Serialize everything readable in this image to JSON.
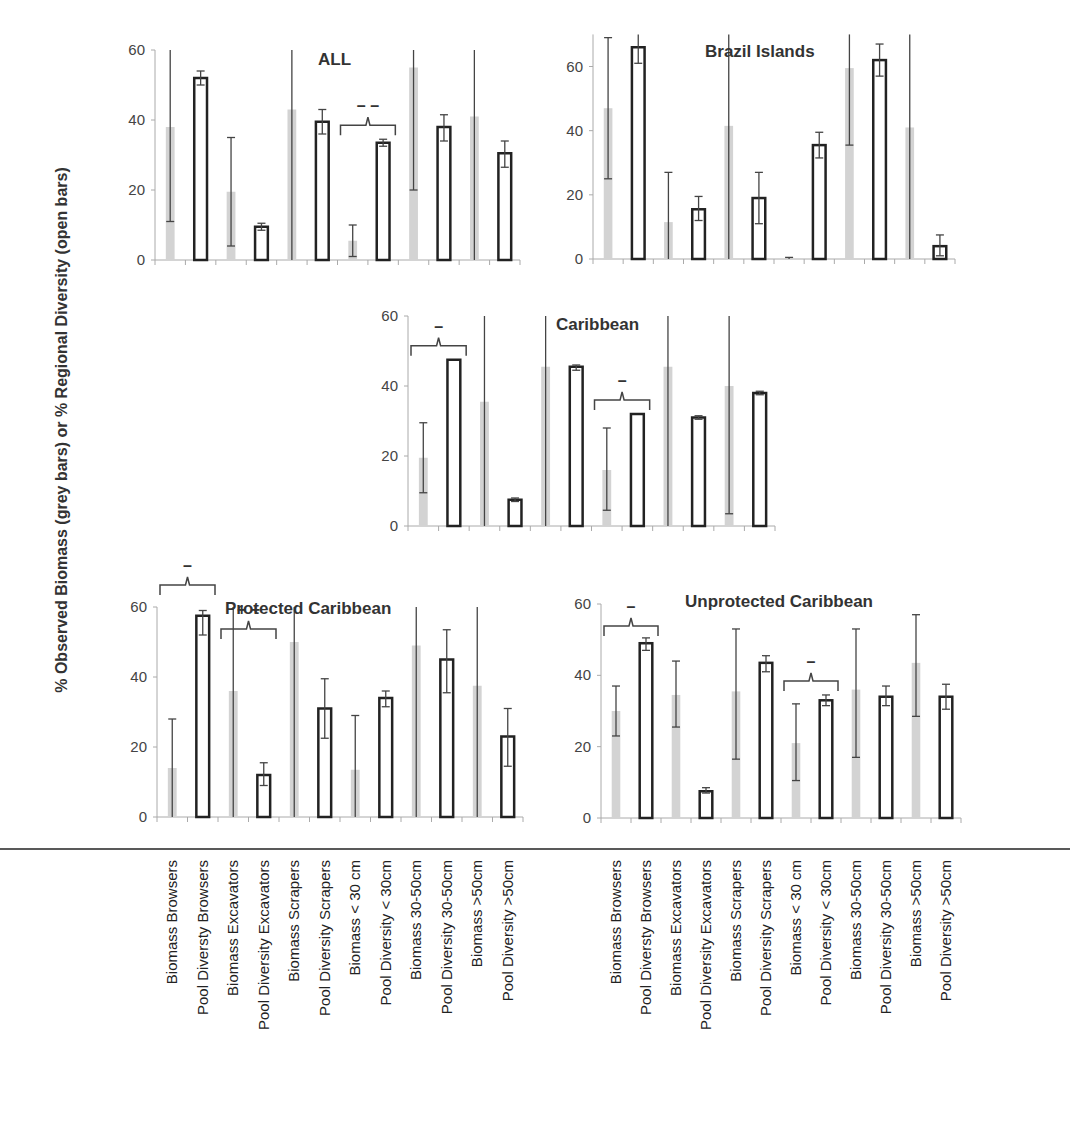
{
  "figure": {
    "y_axis_label": "% Observed Biomass (grey bars) or % Regional Diversity (open bars)",
    "categories": [
      "Biomass Browsers",
      "Pool Diversty Browsers",
      "Biomass Excavators",
      "Pool Diversity Excavators",
      "Biomass Scrapers",
      "Pool Diversity Scrapers",
      "Biomass < 30 cm",
      "Pool Diversity < 30cm",
      "Biomass 30-50cm",
      "Pool Diversity 30-50cm",
      "Biomass >50cm",
      "Pool Diversity >50cm"
    ],
    "colors": {
      "grey_bar": "#d3d3d3",
      "open_bar_stroke": "#222222",
      "axis": "#aaaaaa"
    }
  },
  "chart_data": [
    {
      "type": "bar",
      "title": "ALL",
      "ylabel": "% Observed Biomass (grey bars) or % Regional Diversity (open bars)",
      "ylim": [
        0,
        60
      ],
      "yticks": [
        0,
        20,
        40,
        60
      ],
      "categories": [
        "Biomass Browsers",
        "Pool Diversty Browsers",
        "Biomass Excavators",
        "Pool Diversity Excavators",
        "Biomass Scrapers",
        "Pool Diversity Scrapers",
        "Biomass < 30 cm",
        "Pool Diversity < 30cm",
        "Biomass 30-50cm",
        "Pool Diversity 30-50cm",
        "Biomass >50cm",
        "Pool Diversity >50cm"
      ],
      "bar_style": [
        "grey",
        "open",
        "grey",
        "open",
        "grey",
        "open",
        "grey",
        "open",
        "grey",
        "open",
        "grey",
        "open"
      ],
      "values": [
        38,
        52,
        19.5,
        9.5,
        43,
        39.5,
        5.5,
        33.5,
        55,
        38,
        41,
        30.5
      ],
      "error_low": [
        11,
        50,
        4,
        8.5,
        0,
        36,
        1,
        32.5,
        20,
        34,
        0,
        26.5
      ],
      "error_high": [
        60,
        54,
        35,
        10.5,
        60,
        43,
        10,
        34.5,
        60,
        41.5,
        60,
        34
      ],
      "annotations": [
        {
          "text": "– –",
          "bracket_from": 6,
          "bracket_to": 7
        }
      ],
      "grid": false
    },
    {
      "type": "bar",
      "title": "Brazil Islands",
      "ylim": [
        0,
        70
      ],
      "yticks": [
        0,
        20,
        40,
        60
      ],
      "categories": [
        "Biomass Browsers",
        "Pool Diversty Browsers",
        "Biomass Excavators",
        "Pool Diversity Excavators",
        "Biomass Scrapers",
        "Pool Diversity Scrapers",
        "Biomass < 30 cm",
        "Pool Diversity < 30cm",
        "Biomass 30-50cm",
        "Pool Diversity 30-50cm",
        "Biomass >50cm",
        "Pool Diversity >50cm"
      ],
      "bar_style": [
        "grey",
        "open",
        "grey",
        "open",
        "grey",
        "open",
        "grey",
        "open",
        "grey",
        "open",
        "grey",
        "open"
      ],
      "values": [
        47,
        66,
        11.5,
        15.5,
        41.5,
        19,
        0.3,
        35.5,
        59.5,
        62,
        41,
        4
      ],
      "error_low": [
        25,
        61,
        0,
        12,
        0,
        11,
        0,
        31.5,
        35.5,
        57,
        0,
        1
      ],
      "error_high": [
        69,
        70,
        27,
        19.5,
        70,
        27,
        0.5,
        39.5,
        70,
        67,
        70,
        7.5
      ],
      "annotations": [],
      "grid": false
    },
    {
      "type": "bar",
      "title": "Caribbean",
      "ylim": [
        0,
        60
      ],
      "yticks": [
        0,
        20,
        40,
        60
      ],
      "categories": [
        "Biomass Browsers",
        "Pool Diversty Browsers",
        "Biomass Excavators",
        "Pool Diversity Excavators",
        "Biomass Scrapers",
        "Pool Diversity Scrapers",
        "Biomass < 30 cm",
        "Pool Diversity < 30cm",
        "Biomass 30-50cm",
        "Pool Diversity 30-50cm",
        "Biomass >50cm",
        "Pool Diversity >50cm"
      ],
      "bar_style": [
        "grey",
        "open",
        "grey",
        "open",
        "grey",
        "open",
        "grey",
        "open",
        "grey",
        "open",
        "grey",
        "open"
      ],
      "values": [
        19.5,
        47.5,
        35.5,
        7.5,
        45.5,
        45.5,
        16,
        32,
        45.5,
        31,
        40,
        38
      ],
      "error_low": [
        9.5,
        47.5,
        0,
        7,
        0,
        44.5,
        4.5,
        32,
        0,
        30.5,
        3.5,
        37.5
      ],
      "error_high": [
        29.5,
        47.5,
        60,
        8,
        60,
        46,
        28,
        32,
        60,
        31.5,
        60,
        38.5
      ],
      "annotations": [
        {
          "text": "–",
          "bracket_from": 0,
          "bracket_to": 1
        },
        {
          "text": "–",
          "bracket_from": 6,
          "bracket_to": 7
        }
      ],
      "grid": false
    },
    {
      "type": "bar",
      "title": "Protected Caribbean",
      "ylim": [
        0,
        60
      ],
      "yticks": [
        0,
        20,
        40,
        60
      ],
      "categories": [
        "Biomass Browsers",
        "Pool Diversty Browsers",
        "Biomass Excavators",
        "Pool Diversity Excavators",
        "Biomass Scrapers",
        "Pool Diversity Scrapers",
        "Biomass < 30 cm",
        "Pool Diversity < 30cm",
        "Biomass 30-50cm",
        "Pool Diversity 30-50cm",
        "Biomass >50cm",
        "Pool Diversity >50cm"
      ],
      "bar_style": [
        "grey",
        "open",
        "grey",
        "open",
        "grey",
        "open",
        "grey",
        "open",
        "grey",
        "open",
        "grey",
        "open"
      ],
      "values": [
        14,
        57.5,
        36,
        12,
        50,
        31,
        13.5,
        34,
        49,
        45,
        37.5,
        23
      ],
      "error_low": [
        0,
        52,
        0,
        9,
        0,
        22.5,
        0,
        31.5,
        0,
        35.5,
        0,
        14.5
      ],
      "error_high": [
        28,
        59,
        60,
        15.5,
        60,
        39.5,
        29,
        36,
        60,
        53.5,
        60,
        31
      ],
      "annotations": [
        {
          "text": "–",
          "bracket_from": 0,
          "bracket_to": 1
        },
        {
          "text": "+ +",
          "bracket_from": 2,
          "bracket_to": 3
        }
      ],
      "grid": false
    },
    {
      "type": "bar",
      "title": "Unprotected Caribbean",
      "ylim": [
        0,
        60
      ],
      "yticks": [
        0,
        20,
        40,
        60
      ],
      "categories": [
        "Biomass Browsers",
        "Pool Diversty Browsers",
        "Biomass Excavators",
        "Pool Diversity Excavators",
        "Biomass Scrapers",
        "Pool Diversity Scrapers",
        "Biomass < 30 cm",
        "Pool Diversity < 30cm",
        "Biomass 30-50cm",
        "Pool Diversity 30-50cm",
        "Biomass >50cm",
        "Pool Diversity >50cm"
      ],
      "bar_style": [
        "grey",
        "open",
        "grey",
        "open",
        "grey",
        "open",
        "grey",
        "open",
        "grey",
        "open",
        "grey",
        "open"
      ],
      "values": [
        30,
        49,
        34.5,
        7.5,
        35.5,
        43.5,
        21,
        33,
        36,
        34,
        43.5,
        34
      ],
      "error_low": [
        23,
        47,
        25.5,
        7,
        16.5,
        41,
        10.5,
        31.5,
        17,
        31.5,
        28.5,
        30.5
      ],
      "error_high": [
        37,
        50.5,
        44,
        8.5,
        53,
        45.5,
        32,
        34.5,
        53,
        37,
        57,
        37.5
      ],
      "annotations": [
        {
          "text": "–",
          "bracket_from": 0,
          "bracket_to": 1
        },
        {
          "text": "–",
          "bracket_from": 6,
          "bracket_to": 7
        }
      ],
      "grid": false
    }
  ]
}
